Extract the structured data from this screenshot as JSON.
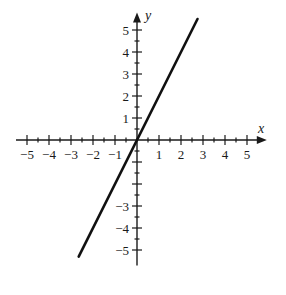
{
  "chart_data": {
    "type": "line",
    "title": "",
    "xlabel": "x",
    "ylabel": "y",
    "xlim": [
      -5.5,
      5.9
    ],
    "ylim": [
      -5.7,
      5.8
    ],
    "grid": false,
    "legend": null,
    "x_ticks": [
      -5,
      -4,
      -3,
      -2,
      -1,
      1,
      2,
      3,
      4,
      5
    ],
    "x_tick_labels": [
      "-5",
      "-4",
      "-3",
      "-2",
      "-1",
      "1",
      "2",
      "3",
      "4",
      "5"
    ],
    "y_ticks": [
      -5,
      -4,
      -3,
      1,
      2,
      3,
      4,
      5
    ],
    "y_tick_labels": [
      "-5",
      "-4",
      "-3",
      "1",
      "2",
      "3",
      "4",
      "5"
    ],
    "minor_tick_step": 0.5,
    "series": [
      {
        "name": "y = 2x",
        "equation": "y = 2x",
        "x": [
          -2.65,
          2.75
        ],
        "y": [
          -5.3,
          5.5
        ],
        "color": "#111111"
      }
    ]
  },
  "colors": {
    "axis": "#1a1a1a",
    "line": "#111111",
    "background": "#ffffff"
  }
}
